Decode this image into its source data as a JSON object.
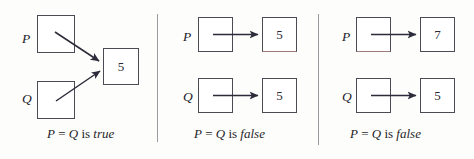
{
  "figure": {
    "type": "reference-equality-diagram",
    "background_color": "#fdfdfc",
    "box_border_color": "#4b4b56",
    "arrow_color": "#2b2b3a",
    "divider_color": "#9a9aa2"
  },
  "panels": [
    {
      "id": "panel-1",
      "caption": {
        "lhs": "P",
        "operator": "=",
        "rhs": "Q",
        "verb": "is",
        "result": "true",
        "full_text": "P = Q is true"
      },
      "variables": [
        {
          "name": "P",
          "box_value": ""
        },
        {
          "name": "Q",
          "box_value": ""
        }
      ],
      "shared_object": {
        "value": "5"
      },
      "arrow_style": "diagonal-converging",
      "arrow_count": 2
    },
    {
      "id": "panel-2",
      "caption": {
        "lhs": "P",
        "operator": "=",
        "rhs": "Q",
        "verb": "is",
        "result": "false",
        "full_text": "P = Q is false"
      },
      "variables": [
        {
          "name": "P",
          "box_value": "",
          "target_value": "5"
        },
        {
          "name": "Q",
          "box_value": "",
          "target_value": "5"
        }
      ],
      "arrow_style": "horizontal-parallel",
      "arrow_count": 2
    },
    {
      "id": "panel-3",
      "caption": {
        "lhs": "P",
        "operator": "=",
        "rhs": "Q",
        "verb": "is",
        "result": "false",
        "full_text": "P = Q is false"
      },
      "variables": [
        {
          "name": "P",
          "box_value": "",
          "target_value": "7"
        },
        {
          "name": "Q",
          "box_value": "",
          "target_value": "5"
        }
      ],
      "arrow_style": "horizontal-parallel",
      "arrow_count": 2
    }
  ]
}
